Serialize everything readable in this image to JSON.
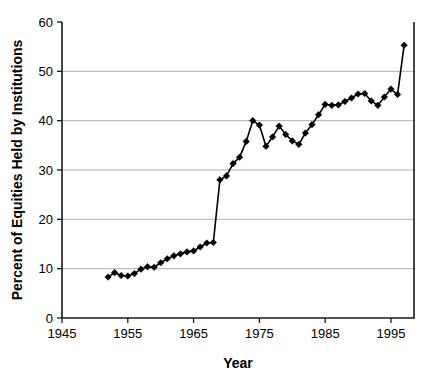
{
  "chart_data": {
    "type": "line",
    "title": "",
    "xlabel": "Year",
    "ylabel": "Percent of Equities Held by Institutions",
    "xlim": [
      1945,
      1998.5
    ],
    "ylim": [
      0,
      60
    ],
    "grid": true,
    "legend": "none",
    "marker": "diamond",
    "marker_color": "#000000",
    "line_color": "#000000",
    "xticks": [
      1945,
      1955,
      1965,
      1975,
      1985,
      1995
    ],
    "xtick_labels": [
      "1945",
      "1955",
      "1965",
      "1975",
      "1985",
      "1995"
    ],
    "yticks": [
      0,
      10,
      20,
      30,
      40,
      50,
      60
    ],
    "ytick_labels": [
      "0",
      "10",
      "20",
      "30",
      "40",
      "50",
      "60"
    ],
    "series": [
      {
        "name": "Percent of Equities Held by Institutions",
        "x": [
          1952,
          1953,
          1954,
          1955,
          1956,
          1957,
          1958,
          1959,
          1960,
          1961,
          1962,
          1963,
          1964,
          1965,
          1966,
          1967,
          1968,
          1969,
          1970,
          1971,
          1972,
          1973,
          1974,
          1975,
          1976,
          1977,
          1978,
          1979,
          1980,
          1981,
          1982,
          1983,
          1984,
          1985,
          1986,
          1987,
          1988,
          1989,
          1990,
          1991,
          1992,
          1993,
          1994,
          1995,
          1996,
          1997
        ],
        "values": [
          8.3,
          9.2,
          8.6,
          8.5,
          9.0,
          9.9,
          10.4,
          10.3,
          11.2,
          12.0,
          12.6,
          13.0,
          13.4,
          13.6,
          14.4,
          15.2,
          15.3,
          28.0,
          28.8,
          31.3,
          32.6,
          35.8,
          40.0,
          39.1,
          34.8,
          36.7,
          38.9,
          37.2,
          35.9,
          35.2,
          37.5,
          39.2,
          41.2,
          43.3,
          43.1,
          43.2,
          43.9,
          44.6,
          45.4,
          45.5,
          44.0,
          43.1,
          44.8,
          46.4,
          45.3,
          55.3
        ]
      }
    ],
    "annotations": {
      "jump_from_year": 1968,
      "jump_to_year": 1969,
      "jump_from_value": 15.3,
      "jump_to_value": 28.0,
      "series_min": 8.3,
      "series_max": 55.3,
      "final_spike_value": 55.3
    }
  },
  "axes": {
    "x_title": "Year",
    "y_title": "Percent of Equities Held by Institutions"
  }
}
